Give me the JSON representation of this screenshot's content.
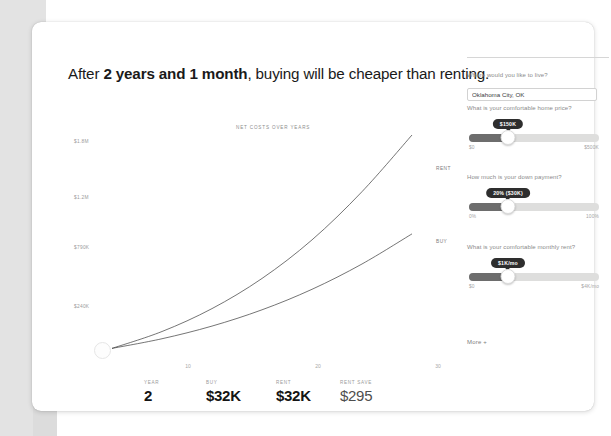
{
  "headline": {
    "prefix": "After ",
    "emphasis": "2 years and 1 month",
    "suffix": ", buying will be cheaper than renting."
  },
  "chart_data": {
    "type": "line",
    "title": "NET COSTS OVER YEARS",
    "xlabel": "",
    "ylabel": "",
    "x": [
      0,
      5,
      10,
      15,
      20,
      25,
      30
    ],
    "xticks": [
      "10",
      "20",
      "30"
    ],
    "xlim": [
      0,
      32
    ],
    "yticks": [
      "$1.8M",
      "$1.2M",
      "$790K",
      "$240K"
    ],
    "ylim": [
      0,
      1800000
    ],
    "grid": false,
    "legend_position": "line-end-labels",
    "series": [
      {
        "name": "RENT",
        "values": [
          30000,
          170000,
          360000,
          610000,
          930000,
          1330000,
          1800000
        ]
      },
      {
        "name": "BUY",
        "values": [
          30000,
          110000,
          215000,
          350000,
          520000,
          730000,
          980000
        ]
      }
    ]
  },
  "stats": [
    {
      "label": "YEAR",
      "value": "2",
      "muted": false
    },
    {
      "label": "BUY",
      "value": "$32K",
      "muted": false
    },
    {
      "label": "RENT",
      "value": "$32K",
      "muted": false
    },
    {
      "label": "RENT SAVE",
      "value": "$295",
      "muted": true
    }
  ],
  "sidebar": {
    "location": {
      "label": "Where would you like to live?",
      "value": "Oklahoma City, OK",
      "placeholder": "Enter a city"
    },
    "home_price": {
      "label": "What is your comfortable home price?",
      "tooltip": "$150K",
      "min_label": "$0",
      "max_label": "$500K",
      "fill_percent": 30
    },
    "down_payment": {
      "label": "How much is your down payment?",
      "tooltip": "20% ($30K)",
      "min_label": "0%",
      "max_label": "100%",
      "fill_percent": 30
    },
    "monthly_rent": {
      "label": "What is your comfortable monthly rent?",
      "tooltip": "$1K/mo",
      "min_label": "$0",
      "max_label": "$4K/mo",
      "fill_percent": 30
    },
    "more_label": "More +"
  }
}
